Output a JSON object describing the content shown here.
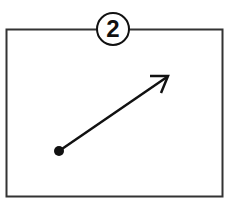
{
  "figure": {
    "step_number": "2",
    "colors": {
      "stroke": "#1a1a1a",
      "background": "#ffffff"
    },
    "arrow": {
      "start": [
        59,
        151
      ],
      "end": [
        168,
        76
      ]
    }
  }
}
